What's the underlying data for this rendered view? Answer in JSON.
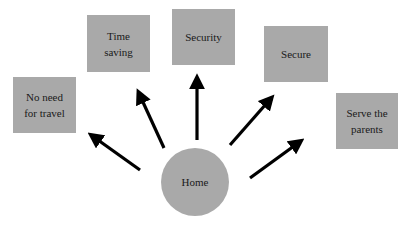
{
  "diagram": {
    "center": {
      "label": "Home",
      "color": "#a9a9a9"
    },
    "nodes": [
      {
        "id": "travel",
        "label": "No need\nfor travel"
      },
      {
        "id": "time",
        "label": "Time\nsaving"
      },
      {
        "id": "security",
        "label": "Security"
      },
      {
        "id": "secure",
        "label": "Secure"
      },
      {
        "id": "parents",
        "label": "Serve the\nparents"
      }
    ],
    "edges": [
      {
        "from": "Home",
        "to": "No need for travel"
      },
      {
        "from": "Home",
        "to": "Time saving"
      },
      {
        "from": "Home",
        "to": "Security"
      },
      {
        "from": "Home",
        "to": "Secure"
      },
      {
        "from": "Home",
        "to": "Serve the parents"
      }
    ],
    "colors": {
      "node_fill": "#a9a9a9",
      "arrow": "#000000",
      "background": "#ffffff"
    }
  }
}
